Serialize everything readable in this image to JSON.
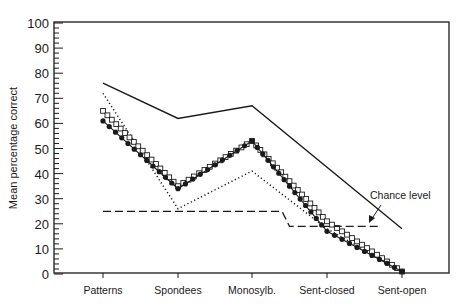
{
  "chart_data": {
    "type": "line",
    "title": "",
    "xlabel": "",
    "ylabel": "Mean percentage correct",
    "ylim": [
      0,
      100
    ],
    "yticks": [
      0,
      10,
      20,
      30,
      40,
      50,
      60,
      70,
      80,
      90,
      100
    ],
    "grid": false,
    "legend": null,
    "categories": [
      "Patterns",
      "Spondees",
      "Monosylb.",
      "Sent-closed",
      "Sent-open"
    ],
    "series": [
      {
        "name": "solid",
        "style": "solid",
        "marker": "none",
        "values": [
          76,
          62,
          67,
          null,
          18
        ]
      },
      {
        "name": "dotted",
        "style": "dotted",
        "marker": "none",
        "values": [
          72,
          26,
          41,
          18,
          1
        ]
      },
      {
        "name": "open-squares",
        "style": "solid",
        "marker": "open-square",
        "values": [
          65,
          35,
          53,
          21,
          1
        ]
      },
      {
        "name": "filled-circles",
        "style": "solid",
        "marker": "filled-circle",
        "values": [
          61,
          34,
          53,
          17,
          1
        ]
      },
      {
        "name": "chance-level",
        "style": "dashed",
        "marker": "none",
        "points": [
          [
            0.0,
            25
          ],
          [
            2.4,
            25
          ],
          [
            2.5,
            19
          ],
          [
            3.7,
            19
          ]
        ]
      }
    ],
    "annotations": [
      {
        "text": "Chance level",
        "arrow_to_series": "chance-level"
      }
    ]
  },
  "labels": {
    "ylabel": "Mean percentage correct",
    "annotation": "Chance level",
    "yticks": [
      "0",
      "10",
      "20",
      "30",
      "40",
      "50",
      "60",
      "70",
      "80",
      "90",
      "100"
    ],
    "categories": [
      "Patterns",
      "Spondees",
      "Monosylb.",
      "Sent-closed",
      "Sent-open"
    ]
  }
}
